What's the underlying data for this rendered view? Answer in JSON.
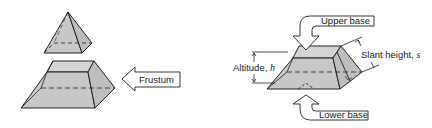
{
  "figure": {
    "left_panel": {
      "shapes": [
        "pyramid-top (cut-off apex)",
        "frustum"
      ],
      "callout": {
        "label": "Frustum"
      }
    },
    "right_panel": {
      "shape": "frustum",
      "callouts": {
        "upper_base": "Upper base",
        "lower_base": "Lower base",
        "altitude": "Altitude, ",
        "altitude_symbol": "h",
        "slant_height": "Slant height, ",
        "slant_symbol": "s"
      }
    },
    "colors": {
      "face_fill": "#c8c8c8",
      "face_light": "#d6d6d6",
      "stroke": "#222222",
      "background": "#ffffff"
    }
  }
}
